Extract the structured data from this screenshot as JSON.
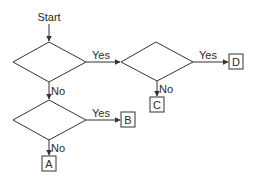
{
  "diagram": {
    "type": "flowchart",
    "start_label": "Start",
    "decisions": [
      {
        "id": "d1",
        "yes_label": "Yes",
        "no_label": "No"
      },
      {
        "id": "d2",
        "yes_label": "Yes",
        "no_label": "No"
      },
      {
        "id": "d3",
        "yes_label": "Yes",
        "no_label": "No"
      }
    ],
    "outcomes": [
      {
        "id": "A",
        "label": "A"
      },
      {
        "id": "B",
        "label": "B"
      },
      {
        "id": "C",
        "label": "C"
      },
      {
        "id": "D",
        "label": "D"
      }
    ],
    "edges": [
      {
        "from": "Start",
        "to": "d1",
        "label": ""
      },
      {
        "from": "d1",
        "to": "d2",
        "label": "Yes"
      },
      {
        "from": "d1",
        "to": "d3",
        "label": "No"
      },
      {
        "from": "d2",
        "to": "D",
        "label": "Yes"
      },
      {
        "from": "d2",
        "to": "C",
        "label": "No"
      },
      {
        "from": "d3",
        "to": "B",
        "label": "Yes"
      },
      {
        "from": "d3",
        "to": "A",
        "label": "No"
      }
    ]
  }
}
